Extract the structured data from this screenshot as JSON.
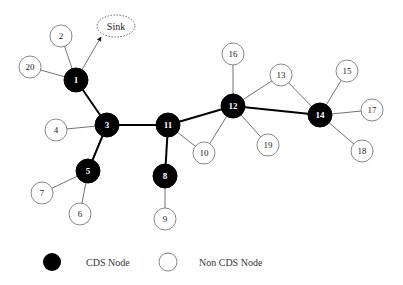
{
  "diagram": {
    "sink": {
      "label": "Sink",
      "x": 116,
      "y": 26,
      "rx": 19,
      "ry": 11
    },
    "colors": {
      "cds_fill": "#000000",
      "non_cds_fill": "#ffffff",
      "stroke": "#555555",
      "edge": "#333333",
      "cds_edge": "#000000"
    },
    "nodes": [
      {
        "id": "1",
        "label": "1",
        "type": "cds",
        "x": 76,
        "y": 80
      },
      {
        "id": "2",
        "label": "2",
        "type": "non_cds",
        "x": 61,
        "y": 36
      },
      {
        "id": "3",
        "label": "3",
        "type": "cds",
        "x": 107,
        "y": 125
      },
      {
        "id": "4",
        "label": "4",
        "type": "non_cds",
        "x": 56,
        "y": 130
      },
      {
        "id": "5",
        "label": "5",
        "type": "cds",
        "x": 88,
        "y": 171
      },
      {
        "id": "6",
        "label": "6",
        "type": "non_cds",
        "x": 80,
        "y": 214
      },
      {
        "id": "7",
        "label": "7",
        "type": "non_cds",
        "x": 42,
        "y": 193
      },
      {
        "id": "8",
        "label": "8",
        "type": "cds",
        "x": 165,
        "y": 176
      },
      {
        "id": "9",
        "label": "9",
        "type": "non_cds",
        "x": 165,
        "y": 219
      },
      {
        "id": "10",
        "label": "10",
        "type": "non_cds",
        "x": 204,
        "y": 153
      },
      {
        "id": "11",
        "label": "11",
        "type": "cds",
        "x": 168,
        "y": 125
      },
      {
        "id": "12",
        "label": "12",
        "type": "cds",
        "x": 233,
        "y": 106
      },
      {
        "id": "13",
        "label": "13",
        "type": "non_cds",
        "x": 281,
        "y": 75
      },
      {
        "id": "14",
        "label": "14",
        "type": "cds",
        "x": 320,
        "y": 115
      },
      {
        "id": "15",
        "label": "15",
        "type": "non_cds",
        "x": 347,
        "y": 71
      },
      {
        "id": "16",
        "label": "16",
        "type": "non_cds",
        "x": 233,
        "y": 54
      },
      {
        "id": "17",
        "label": "17",
        "type": "non_cds",
        "x": 372,
        "y": 110
      },
      {
        "id": "18",
        "label": "18",
        "type": "non_cds",
        "x": 362,
        "y": 151
      },
      {
        "id": "19",
        "label": "19",
        "type": "non_cds",
        "x": 268,
        "y": 145
      },
      {
        "id": "20",
        "label": "20",
        "type": "non_cds",
        "x": 30,
        "y": 67
      }
    ],
    "edges": [
      {
        "from": "1",
        "to": "3",
        "backbone": true
      },
      {
        "from": "3",
        "to": "5",
        "backbone": true
      },
      {
        "from": "3",
        "to": "11",
        "backbone": true
      },
      {
        "from": "11",
        "to": "8",
        "backbone": true
      },
      {
        "from": "11",
        "to": "12",
        "backbone": true
      },
      {
        "from": "12",
        "to": "14",
        "backbone": true
      },
      {
        "from": "1",
        "to": "2",
        "backbone": false
      },
      {
        "from": "1",
        "to": "20",
        "backbone": false
      },
      {
        "from": "3",
        "to": "4",
        "backbone": false
      },
      {
        "from": "5",
        "to": "7",
        "backbone": false
      },
      {
        "from": "5",
        "to": "6",
        "backbone": false
      },
      {
        "from": "8",
        "to": "9",
        "backbone": false
      },
      {
        "from": "11",
        "to": "10",
        "backbone": false
      },
      {
        "from": "12",
        "to": "10",
        "backbone": false
      },
      {
        "from": "12",
        "to": "16",
        "backbone": false
      },
      {
        "from": "12",
        "to": "13",
        "backbone": false
      },
      {
        "from": "12",
        "to": "19",
        "backbone": false
      },
      {
        "from": "13",
        "to": "14",
        "backbone": false
      },
      {
        "from": "14",
        "to": "15",
        "backbone": false
      },
      {
        "from": "14",
        "to": "17",
        "backbone": false
      },
      {
        "from": "14",
        "to": "18",
        "backbone": false
      }
    ],
    "sink_arrow": {
      "from": "1",
      "to_x": 101,
      "to_y": 37
    }
  },
  "legend": {
    "cds_label": "CDS Node",
    "non_cds_label": "Non CDS Node"
  }
}
